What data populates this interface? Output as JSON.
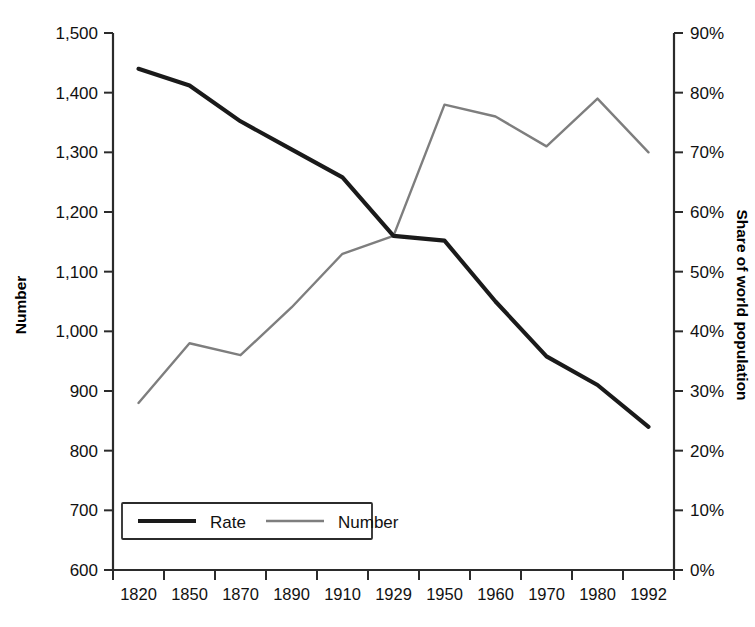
{
  "chart_data": {
    "type": "line",
    "title": "",
    "xlabel": "",
    "categories": [
      "1820",
      "1850",
      "1870",
      "1890",
      "1910",
      "1929",
      "1950",
      "1960",
      "1970",
      "1980",
      "1992"
    ],
    "grid": false,
    "legend_position": "bottom-left",
    "axes": {
      "left": {
        "label": "Number",
        "ylim": [
          600,
          1500
        ],
        "ticks": [
          600,
          700,
          800,
          900,
          1000,
          1100,
          1200,
          1300,
          1400,
          1500
        ],
        "tick_labels": [
          "600",
          "700",
          "800",
          "900",
          "1,000",
          "1,100",
          "1,200",
          "1,300",
          "1,400",
          "1,500"
        ]
      },
      "right": {
        "label": "Share of world population",
        "ylim": [
          0,
          90
        ],
        "ticks": [
          0,
          10,
          20,
          30,
          40,
          50,
          60,
          70,
          80,
          90
        ],
        "tick_labels": [
          "0%",
          "10%",
          "20%",
          "30%",
          "40%",
          "50%",
          "60%",
          "70%",
          "80%",
          "90%"
        ]
      }
    },
    "series": [
      {
        "name": "Rate",
        "axis": "left",
        "color": "#1a1a1a",
        "values": [
          1440,
          1412,
          1352,
          1305,
          1258,
          1160,
          1152,
          1050,
          958,
          910,
          840
        ]
      },
      {
        "name": "Number",
        "axis": "right",
        "color": "#7e7e7e",
        "values": [
          28,
          38,
          36,
          44,
          53,
          56,
          78,
          76,
          71,
          79,
          70
        ]
      }
    ]
  },
  "legend": {
    "items": [
      {
        "label": "Rate"
      },
      {
        "label": "Number"
      }
    ]
  },
  "colors": {
    "rate": "#1a1a1a",
    "number": "#7e7e7e",
    "axis": "#2b2b2b",
    "background": "#ffffff"
  }
}
